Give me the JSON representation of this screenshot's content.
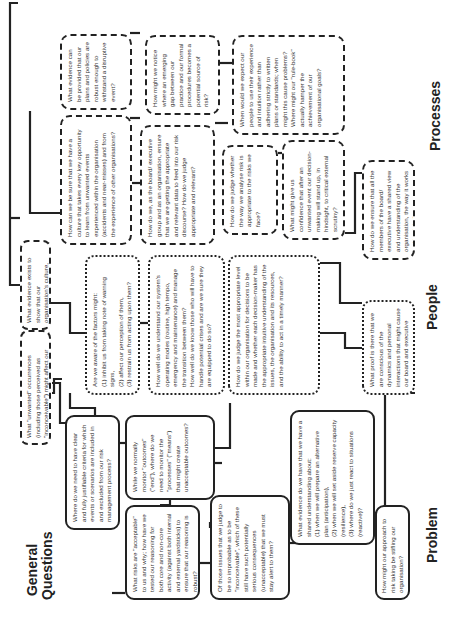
{
  "labels": {
    "general_questions": "General\nQuestions",
    "problem": "Problem",
    "people": "People",
    "processes": "Processes"
  },
  "general": {
    "unwanted_occurrences": "What \"unwanted\" occurrences (including those perceived as \"inconceivable\") might affect our organisation?",
    "evidence_culture": "What evidence exists to show that our organisation's culture, structure or processes do NOT provoke errors or rule violations?"
  },
  "problem": {
    "boxes": [
      {
        "text": "Where do we need to have clear and fully justifiable criteria for which events or scenarios are included in and excluded from our risk management process?"
      },
      {
        "text": "While we normally monitor \"outcomes\" (\"end\"), where do we need to monitor the \"processes\" (\"means\") that might create unacceptable outcomes?"
      },
      {
        "text": "What risks are \"acceptable\" to us and why; how have we tested our reasoning for both core and non-core activity (against both internal and external yardsticks) to ensure that our reasoning is robust?"
      },
      {
        "text": "Of those issues that we judge to be so improbable as to be \"inconceivable\", which of these still have such potentially serious consequences (unacceptable) that we must stay alert to them?"
      },
      {
        "text": "What evidence do we have that we have a shared understanding about:\n(1) when we will prepare an alternative plan (anticipation),\n(2) when we will set aside reserve capacity (resilience),\n(3) where do we just react to situations (reactive)?"
      },
      {
        "text": "How might our approach to risk taking be stifling our organisation?"
      }
    ]
  },
  "people": {
    "boxes": [
      {
        "text": "Are we aware of the factors might:\n(1) inhibit us from taking note of warning signs,\n(2) affect our perception of them,\n(3) restrain us from acting upon them?"
      },
      {
        "text": "How well do we understand our system's operating modes (routine, high tempo, emergency and maintenance) and manage the transition between them?\nHow well do we know those who will have to handle potential crises and are we sure they are equipped to do so?"
      },
      {
        "text": "How do we judge the most appropriate level within our organisation for decisions to be made and whether each decision-maker has the appropriate intuitive understanding of the issues, the organisation and its resources, and the ability to act in a timely manner?"
      },
      {
        "text": "What proof is there that we are conscious of the dynamics and personal interactions that might cause our board and executive team to be dysfunctional (thereby generating risk) and what are we doing to ensure that we do not fall into these traps?"
      }
    ]
  },
  "processes": {
    "boxes": [
      {
        "text": "What evidence can be provided that our plans and policies are robust enough to withstand a disruptive event?"
      },
      {
        "text": "How might we notice where an emerging gap between our practice and our formal procedures becomes a potential source of risk?"
      },
      {
        "text": "How can we be sure that we have a culture that takes every key opportunity to learn from unwanted events experienced within the organisation (accidents and near-misses) and from the experience of other organisations?"
      },
      {
        "text": "How do we, as the board/ executive group and as an organisation, ensure that we are getting the appropriate and relevant data to feed into our risk discourse? How do we judge appropriate and relevant?"
      },
      {
        "text": "When would we expect our people to use their experience and intuition rather than adhering strictly to written plans or standards; when might this cause problems?\nWhere might our \"rule-book\" actually hamper the achievement of our organisational goals?"
      },
      {
        "text": "How do we judge whether the way we analyse risk is appropriate to the risks we face?"
      },
      {
        "text": "What might give us confidence that after an unwanted event our decision-making will stand up, in hindsight, to critical external scrutiny?"
      },
      {
        "text": "How do we ensure that all the members of the board/ executive have a shared view and understanding of the organisation, the way it works and its risks?"
      }
    ]
  },
  "colors": {
    "ink": "#222222",
    "text": "#333333",
    "background": "#ffffff"
  }
}
